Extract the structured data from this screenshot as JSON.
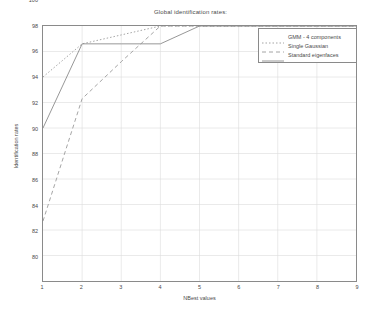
{
  "chart_data": {
    "type": "line",
    "title": "Global identification rates:",
    "xlabel": "NBest values",
    "ylabel": "Identification rates",
    "xlim": [
      1,
      9
    ],
    "ylim": [
      80,
      100
    ],
    "xticks": [
      "1",
      "2",
      "3",
      "4",
      "5",
      "6",
      "7",
      "8",
      "9"
    ],
    "yticks": [
      "80",
      "82",
      "84",
      "86",
      "88",
      "90",
      "92",
      "94",
      "96",
      "98",
      "100"
    ],
    "grid": true,
    "legend_position": "top-right",
    "x": [
      1,
      2,
      3,
      4,
      5,
      6,
      7,
      8,
      9
    ],
    "series": [
      {
        "name": "GMM - 4 components",
        "style": "dashdot",
        "color": "#9a9a9a",
        "values": [
          96.0,
          98.6,
          99.3,
          100.0,
          100.0,
          100.0,
          100.0,
          100.0,
          100.0
        ]
      },
      {
        "name": "Single Gaussian",
        "style": "dashed",
        "color": "#9a9a9a",
        "values": [
          84.7,
          94.3,
          97.2,
          100.0,
          100.0,
          100.0,
          100.0,
          100.0,
          100.0
        ]
      },
      {
        "name": "Standard eigenfaces",
        "style": "solid",
        "color": "#8a8a8a",
        "values": [
          92.0,
          98.6,
          98.6,
          98.6,
          100.0,
          100.0,
          100.0,
          100.0,
          100.0
        ]
      }
    ]
  },
  "colors": {
    "axis": "#8a8a8a",
    "grid": "#dcdcdc",
    "text": "#4a4a4a",
    "background": "#ffffff"
  }
}
